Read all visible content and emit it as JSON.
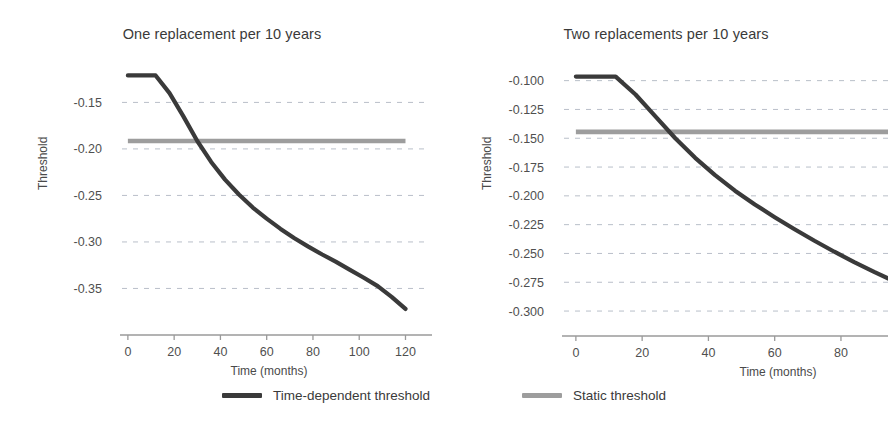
{
  "figure": {
    "width": 888,
    "height": 434,
    "background": "#ffffff"
  },
  "colors": {
    "dynamic_line": "#3a3a3a",
    "static_line": "#9d9d9d",
    "grid": "#b9bfc9",
    "axis": "#9a9a9a",
    "text": "#4a4a4a"
  },
  "legend": {
    "position": "bottom-center",
    "items": [
      {
        "label": "Time-dependent threshold",
        "color": "#3a3a3a",
        "swatch": "line-swatch-dark"
      },
      {
        "label": "Static threshold",
        "color": "#9d9d9d",
        "swatch": "line-swatch-gray"
      }
    ]
  },
  "chart_data": [
    {
      "type": "line",
      "panel": "left",
      "title": "One replacement per 10 years",
      "xlabel": "Time (months)",
      "ylabel": "Threshold",
      "grid": true,
      "xlim": [
        -6,
        128
      ],
      "ylim": [
        -0.385,
        -0.113
      ],
      "xticks": [
        0,
        20,
        40,
        60,
        80,
        100,
        120
      ],
      "xticklabels": [
        "0",
        "20",
        "40",
        "60",
        "80",
        "100",
        "120"
      ],
      "yticks": [
        -0.15,
        -0.2,
        -0.25,
        -0.3,
        -0.35
      ],
      "yticklabels": [
        "-0.15",
        "-0.20",
        "-0.25",
        "-0.30",
        "-0.35"
      ],
      "series": [
        {
          "name": "Time-dependent threshold",
          "color": "#3a3a3a",
          "x": [
            0,
            6,
            12,
            18,
            24,
            30,
            36,
            42,
            48,
            54,
            60,
            66,
            72,
            78,
            84,
            90,
            96,
            102,
            108,
            114,
            120
          ],
          "values": [
            -0.121,
            -0.121,
            -0.121,
            -0.14,
            -0.165,
            -0.1915,
            -0.214,
            -0.233,
            -0.249,
            -0.263,
            -0.275,
            -0.286,
            -0.296,
            -0.305,
            -0.3135,
            -0.3215,
            -0.33,
            -0.3385,
            -0.3475,
            -0.359,
            -0.372
          ]
        },
        {
          "name": "Static threshold",
          "color": "#9d9d9d",
          "x": [
            0,
            120
          ],
          "values": [
            -0.1915,
            -0.1915
          ]
        }
      ],
      "annotations": [
        {
          "text": "curves cross near 30 months",
          "x": 30,
          "y": -0.1915
        }
      ]
    },
    {
      "type": "line",
      "panel": "right",
      "title": "Two replacements per 10 years",
      "xlabel": "Time (months)",
      "ylabel": "Threshold",
      "grid": true,
      "xlim": [
        -6,
        128
      ],
      "ylim": [
        -0.3095,
        -0.0925
      ],
      "xticks": [
        0,
        20,
        40,
        60,
        80,
        100,
        120
      ],
      "xticklabels": [
        "0",
        "20",
        "40",
        "60",
        "80",
        "100",
        "120"
      ],
      "yticks": [
        -0.1,
        -0.125,
        -0.15,
        -0.175,
        -0.2,
        -0.225,
        -0.25,
        -0.275,
        -0.3
      ],
      "yticklabels": [
        "-0.100",
        "-0.125",
        "-0.150",
        "-0.175",
        "-0.200",
        "-0.225",
        "-0.250",
        "-0.275",
        "-0.300"
      ],
      "series": [
        {
          "name": "Time-dependent threshold",
          "color": "#3a3a3a",
          "x": [
            0,
            6,
            12,
            18,
            24,
            30,
            36,
            42,
            48,
            54,
            60,
            66,
            72,
            78,
            84,
            90,
            96,
            102,
            108,
            114,
            120
          ],
          "values": [
            -0.0965,
            -0.0965,
            -0.0965,
            -0.112,
            -0.131,
            -0.15,
            -0.167,
            -0.182,
            -0.1955,
            -0.2075,
            -0.2185,
            -0.229,
            -0.239,
            -0.2485,
            -0.2575,
            -0.266,
            -0.274,
            -0.282,
            -0.2895,
            -0.2955,
            -0.3
          ]
        },
        {
          "name": "Static threshold",
          "color": "#9d9d9d",
          "x": [
            0,
            120
          ],
          "values": [
            -0.1445,
            -0.1445
          ]
        }
      ],
      "annotations": [
        {
          "text": "curves cross near 28 months",
          "x": 28,
          "y": -0.1445
        }
      ]
    }
  ]
}
